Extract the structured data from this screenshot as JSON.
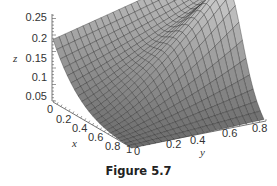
{
  "caption": "Figure 5.7",
  "chart_data": {
    "type": "surface3d",
    "title": "",
    "caption": "Figure 5.7",
    "xlabel": "x",
    "ylabel": "y",
    "zlabel": "z",
    "x_ticks": [
      "0",
      "0.2",
      "0.4",
      "0.6",
      "0.8",
      "1"
    ],
    "y_ticks": [
      "0",
      "0.2",
      "0.4",
      "0.6",
      "0.8"
    ],
    "z_ticks": [
      "0.05",
      "0.1",
      "0.15",
      "0.2",
      "0.25"
    ],
    "xlim": [
      0,
      1
    ],
    "ylim": [
      0,
      1
    ],
    "zlim": [
      0,
      0.25
    ],
    "grid": false,
    "surface_color": "#9a9a9a",
    "mesh_color": "#222222"
  },
  "axes": {
    "z_label": "z",
    "x_label": "x",
    "y_label": "y"
  }
}
